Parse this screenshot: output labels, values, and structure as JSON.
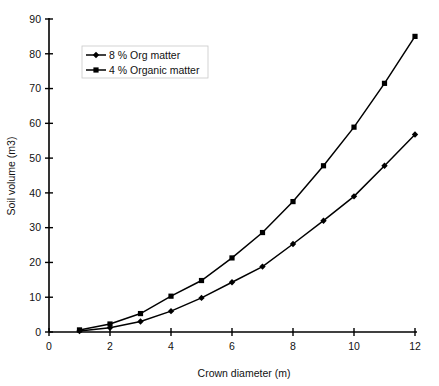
{
  "chart_data": {
    "type": "line",
    "title": "",
    "xlabel": "Crown diameter (m)",
    "ylabel": "Soil volume (m3)",
    "xlim": [
      0,
      12
    ],
    "ylim": [
      0,
      90
    ],
    "xticks": [
      0,
      2,
      4,
      6,
      8,
      10,
      12
    ],
    "yticks": [
      0,
      10,
      20,
      30,
      40,
      50,
      60,
      70,
      80,
      90
    ],
    "xtick_labels": [
      "0",
      "2",
      "4",
      "6",
      "8",
      "10",
      "12"
    ],
    "ytick_labels": [
      "0",
      "10",
      "20",
      "30",
      "40",
      "50",
      "60",
      "70",
      "80",
      "90"
    ],
    "grid": false,
    "legend_position": "upper-left-inset",
    "x": [
      1,
      2,
      3,
      4,
      5,
      6,
      7,
      8,
      9,
      10,
      11,
      12
    ],
    "series": [
      {
        "name": "8 % Org  matter",
        "marker": "diamond",
        "color": "#000000",
        "values": [
          0.3,
          1.2,
          3.0,
          6.0,
          9.8,
          14.3,
          18.8,
          25.3,
          32.0,
          39.0,
          47.8,
          56.8
        ]
      },
      {
        "name": "4 % Organic matter",
        "marker": "square",
        "color": "#000000",
        "values": [
          0.6,
          2.3,
          5.3,
          10.3,
          14.8,
          21.3,
          28.6,
          37.5,
          47.8,
          58.9,
          71.5,
          85.0
        ]
      }
    ],
    "legend": [
      {
        "label": "8 % Org  matter",
        "marker": "diamond"
      },
      {
        "label": "4 % Organic matter",
        "marker": "square"
      }
    ],
    "colors": {
      "axis": "#000000",
      "text": "#111111",
      "background": "#ffffff",
      "series_8pct": "#000000",
      "series_4pct": "#000000"
    }
  }
}
